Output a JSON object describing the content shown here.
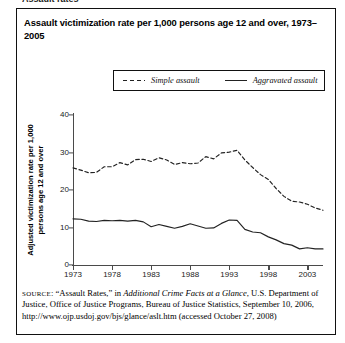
{
  "top_clipped_text": "Assault rates",
  "title": "Assault victimization rate per 1,000 persons age 12 and over, 1973–2005",
  "legend": {
    "items": [
      {
        "label": "Simple assault",
        "style": "dashed",
        "color": "#222222"
      },
      {
        "label": "Aggravated assault",
        "style": "solid",
        "color": "#222222"
      }
    ]
  },
  "source": {
    "label": "SOURCE",
    "text_1": ": “Assault Rates,” in ",
    "italic_1": "Additional Crime Facts at a Glance",
    "text_2": ", U.S. Department of Justice, Office of Justice Programs, Bureau of Justice Statistics, September 10, 2006, http://www.ojp.usdoj.gov/bjs/glance/aslt.htm (accessed October 27, 2008)"
  },
  "chart_data": {
    "type": "line",
    "title": "Assault victimization rate per 1,000 persons age 12 and over, 1973–2005",
    "xlabel": "",
    "ylabel": "Adjusted victimization rate per 1,000 persons age 12 and over",
    "xlim": [
      1973,
      2005
    ],
    "ylim": [
      0,
      40
    ],
    "yticks": [
      0,
      10,
      20,
      30,
      40
    ],
    "xticks": [
      1973,
      1978,
      1983,
      1988,
      1993,
      1998,
      2003
    ],
    "grid": false,
    "legend_position": "top",
    "x": [
      1973,
      1974,
      1975,
      1976,
      1977,
      1978,
      1979,
      1980,
      1981,
      1982,
      1983,
      1984,
      1985,
      1986,
      1987,
      1988,
      1989,
      1990,
      1991,
      1992,
      1993,
      1994,
      1995,
      1996,
      1997,
      1998,
      1999,
      2000,
      2001,
      2002,
      2003,
      2004,
      2005
    ],
    "series": [
      {
        "name": "Simple assault",
        "style": "dashed",
        "color": "#222222",
        "values": [
          25.9,
          25.3,
          24.6,
          24.7,
          26.2,
          26.2,
          27.3,
          26.7,
          28.1,
          28.2,
          27.6,
          28.6,
          28.0,
          26.8,
          27.3,
          27.0,
          27.2,
          28.9,
          28.3,
          29.9,
          30.1,
          30.6,
          28.0,
          26.0,
          24.1,
          22.8,
          20.4,
          18.3,
          17.0,
          16.8,
          16.2,
          15.2,
          14.6
        ]
      },
      {
        "name": "Aggravated assault",
        "style": "solid",
        "color": "#222222",
        "values": [
          12.3,
          12.2,
          11.7,
          11.6,
          11.9,
          11.8,
          11.9,
          11.7,
          11.9,
          11.5,
          10.2,
          10.8,
          10.3,
          9.8,
          10.3,
          11.0,
          10.4,
          9.8,
          9.9,
          11.1,
          12.0,
          11.9,
          9.5,
          8.8,
          8.6,
          7.5,
          6.7,
          5.7,
          5.3,
          4.3,
          4.6,
          4.3,
          4.3
        ]
      }
    ]
  }
}
